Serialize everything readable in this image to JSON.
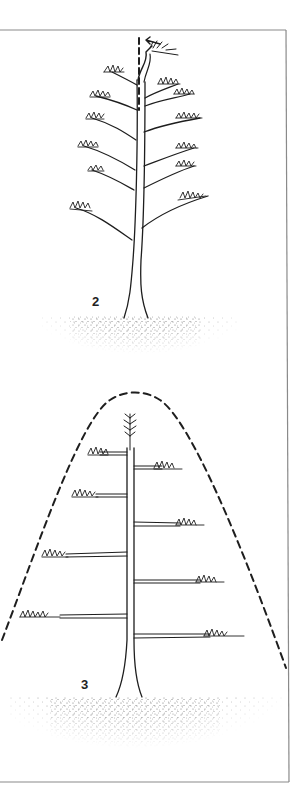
{
  "figure": {
    "frame_color": "#8a8a8a",
    "ink_color": "#1e1e1e",
    "panels": [
      {
        "id": "panel-2",
        "label": "2",
        "subject": "pine tree with leader bent and guide stake line",
        "guide": "vertical-dashed-line-with-arrow"
      },
      {
        "id": "panel-3",
        "label": "3",
        "subject": "pine tree with horizontal tiered branches",
        "guide": "dashed-conical-outline"
      }
    ]
  }
}
